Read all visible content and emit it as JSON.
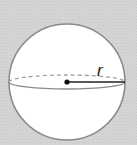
{
  "diagram": {
    "type": "sphere",
    "label_radius": "r",
    "colors": {
      "background": "#d4d4d4",
      "sphere_fill": "#ffffff",
      "outline": "#8a8a8a",
      "radius_line": "#222222",
      "center_dot": "#111111"
    },
    "geometry": {
      "center": [
        67,
        82
      ],
      "radius": 58,
      "equator_ry": 7
    }
  }
}
